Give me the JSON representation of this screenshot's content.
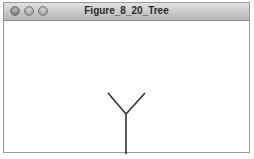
{
  "window": {
    "title": "Figure_8_20_Tree",
    "controls": [
      "close",
      "minimize",
      "maximize"
    ]
  },
  "canvas": {
    "background": "#ffffff",
    "stroke_color": "#333333",
    "tree": {
      "trunk": {
        "x1": 122,
        "y1": 133,
        "x2": 122,
        "y2": 93
      },
      "left_branch": {
        "x1": 122,
        "y1": 93,
        "x2": 104,
        "y2": 72
      },
      "right_branch": {
        "x1": 122,
        "y1": 93,
        "x2": 141,
        "y2": 72
      }
    }
  }
}
